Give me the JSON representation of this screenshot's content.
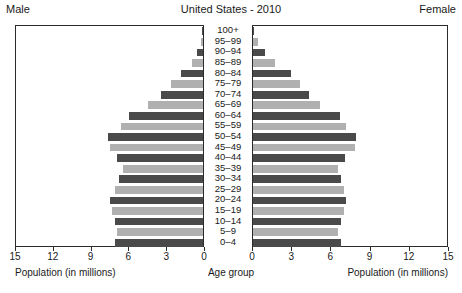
{
  "header": {
    "left_label": "Male",
    "title": "United States - 2010",
    "right_label": "Female"
  },
  "axes": {
    "male_axis_title": "Population (in millions)",
    "center_axis_title": "Age group",
    "female_axis_title": "Population (in millions)",
    "male_ticks": [
      "15",
      "12",
      "9",
      "6",
      "3",
      "0"
    ],
    "female_ticks": [
      "0",
      "3",
      "6",
      "9",
      "12",
      "15"
    ]
  },
  "colors": {
    "bar_dark": "#4a4a4a",
    "bar_light": "#b0b0b0",
    "frame": "#2a2a2a",
    "text": "#1a1a1a",
    "background": "#ffffff"
  },
  "chart_data": {
    "type": "bar",
    "subtype": "population-pyramid",
    "title": "United States - 2010",
    "xlabel": "Population (in millions)",
    "ylabel": "Age group",
    "xlim": [
      0,
      15
    ],
    "grid": false,
    "legend": "none",
    "categories": [
      "100+",
      "95–99",
      "90–94",
      "85–89",
      "80–84",
      "75–79",
      "70–74",
      "65–69",
      "60–64",
      "55–59",
      "50–54",
      "45–49",
      "40–44",
      "35–39",
      "30–34",
      "25–29",
      "20–24",
      "15–19",
      "10–14",
      "5–9",
      "0–4"
    ],
    "series": [
      {
        "name": "Male",
        "side": "left",
        "values": [
          0.01,
          0.15,
          0.45,
          0.9,
          1.8,
          2.6,
          3.4,
          4.4,
          5.9,
          6.6,
          7.6,
          7.5,
          6.9,
          6.4,
          6.7,
          7.1,
          7.5,
          7.3,
          7.1,
          6.9,
          7.1
        ]
      },
      {
        "name": "Female",
        "side": "right",
        "values": [
          0.04,
          0.35,
          0.95,
          1.7,
          2.9,
          3.6,
          4.3,
          5.2,
          6.7,
          7.2,
          8.0,
          7.9,
          7.1,
          6.6,
          6.8,
          7.0,
          7.2,
          7.0,
          6.8,
          6.6,
          6.8
        ]
      }
    ]
  }
}
